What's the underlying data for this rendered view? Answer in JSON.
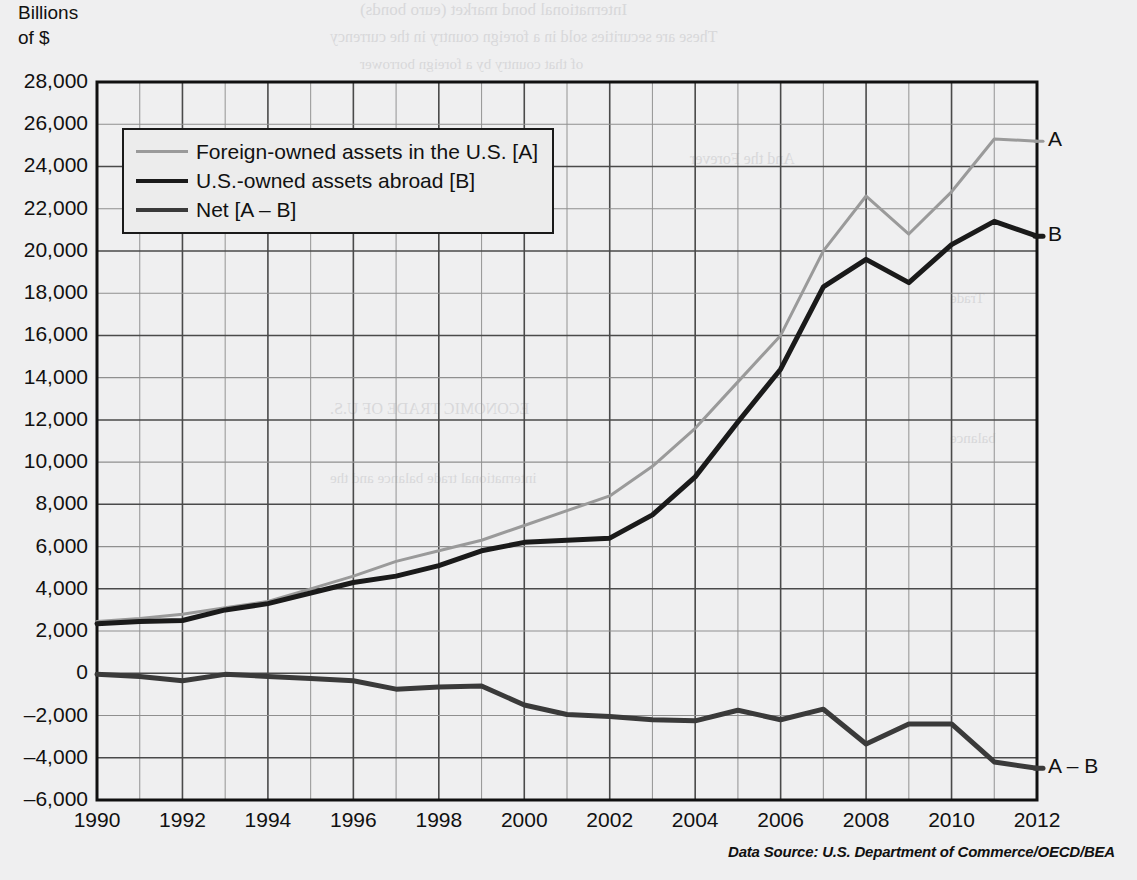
{
  "axis_title": "Billions\nof $",
  "source_note": "Data Source: U.S. Department of Commerce/OECD/BEA",
  "legend": {
    "items": [
      {
        "label": "Foreign-owned assets in the U.S. [A]",
        "color": "#9a9a9a",
        "key": "A"
      },
      {
        "label": "U.S.-owned assets abroad [B]",
        "color": "#1a1a1a",
        "key": "B"
      },
      {
        "label": "Net [A – B]",
        "color": "#3a3a3a",
        "key": "A-B"
      }
    ]
  },
  "end_labels": [
    {
      "text": "A",
      "value": 25200
    },
    {
      "text": "B",
      "value": 20700
    },
    {
      "text": "A – B",
      "value": -4500
    }
  ],
  "bleed_text": {
    "line1": "International bond market (euro bonds)",
    "line2": "These are securities sold in a foreign country in the currency",
    "line3": "of that country by a foreign borrower",
    "line4": "And the Forever",
    "line5": "ECONOMIC TRADE OF U.S.",
    "line6": "international trade balance and the",
    "line7": "Trade",
    "line8": "balance"
  },
  "chart_data": {
    "type": "line",
    "title": "",
    "xlabel": "",
    "ylabel": "Billions of $",
    "xlim": [
      1990,
      2012
    ],
    "ylim": [
      -6000,
      28000
    ],
    "ytick_step": 2000,
    "xtick_step": 2,
    "grid": true,
    "minor_grid_x_step": 1,
    "legend_position": "inside-top-left",
    "yticks": [
      28000,
      26000,
      24000,
      22000,
      20000,
      18000,
      16000,
      14000,
      12000,
      10000,
      8000,
      6000,
      4000,
      2000,
      0,
      -2000,
      -4000,
      -6000
    ],
    "ytick_labels": [
      "28,000",
      "26,000",
      "24,000",
      "22,000",
      "20,000",
      "18,000",
      "16,000",
      "14,000",
      "12,000",
      "10,000",
      "8,000",
      "6,000",
      "4,000",
      "2,000",
      "0",
      "–2,000",
      "–4,000",
      "–6,000"
    ],
    "xticks": [
      1990,
      1992,
      1994,
      1996,
      1998,
      2000,
      2002,
      2004,
      2006,
      2008,
      2010,
      2012
    ],
    "xtick_labels": [
      "1990",
      "1992",
      "1994",
      "1996",
      "1998",
      "2000",
      "2002",
      "2004",
      "2006",
      "2008",
      "2010",
      "2012"
    ],
    "x": [
      1990,
      1991,
      1992,
      1993,
      1994,
      1995,
      1996,
      1997,
      1998,
      1999,
      2000,
      2001,
      2002,
      2003,
      2004,
      2005,
      2006,
      2007,
      2008,
      2009,
      2010,
      2011,
      2012
    ],
    "series": [
      {
        "name": "Foreign-owned assets in the U.S. [A]",
        "key": "A",
        "color": "#9a9a9a",
        "width": 3,
        "values": [
          2450,
          2600,
          2800,
          3100,
          3400,
          4000,
          4600,
          5300,
          5800,
          6300,
          7000,
          7700,
          8400,
          9800,
          11600,
          13800,
          16000,
          20000,
          22600,
          20800,
          22800,
          25300,
          25200
        ]
      },
      {
        "name": "U.S.-owned assets abroad [B]",
        "key": "B",
        "color": "#1a1a1a",
        "width": 5,
        "values": [
          2350,
          2450,
          2500,
          3000,
          3300,
          3800,
          4300,
          4600,
          5100,
          5800,
          6200,
          6300,
          6400,
          7500,
          9300,
          11900,
          14400,
          18300,
          19600,
          18500,
          20300,
          21400,
          20700
        ]
      },
      {
        "name": "Net [A – B]",
        "key": "A-B",
        "color": "#3a3a3a",
        "width": 5,
        "values": [
          -50,
          -150,
          -350,
          -50,
          -150,
          -250,
          -350,
          -750,
          -650,
          -600,
          -1500,
          -1950,
          -2050,
          -2200,
          -2250,
          -1750,
          -2200,
          -1700,
          -3350,
          -2400,
          -2400,
          -4200,
          -4500
        ]
      }
    ]
  }
}
